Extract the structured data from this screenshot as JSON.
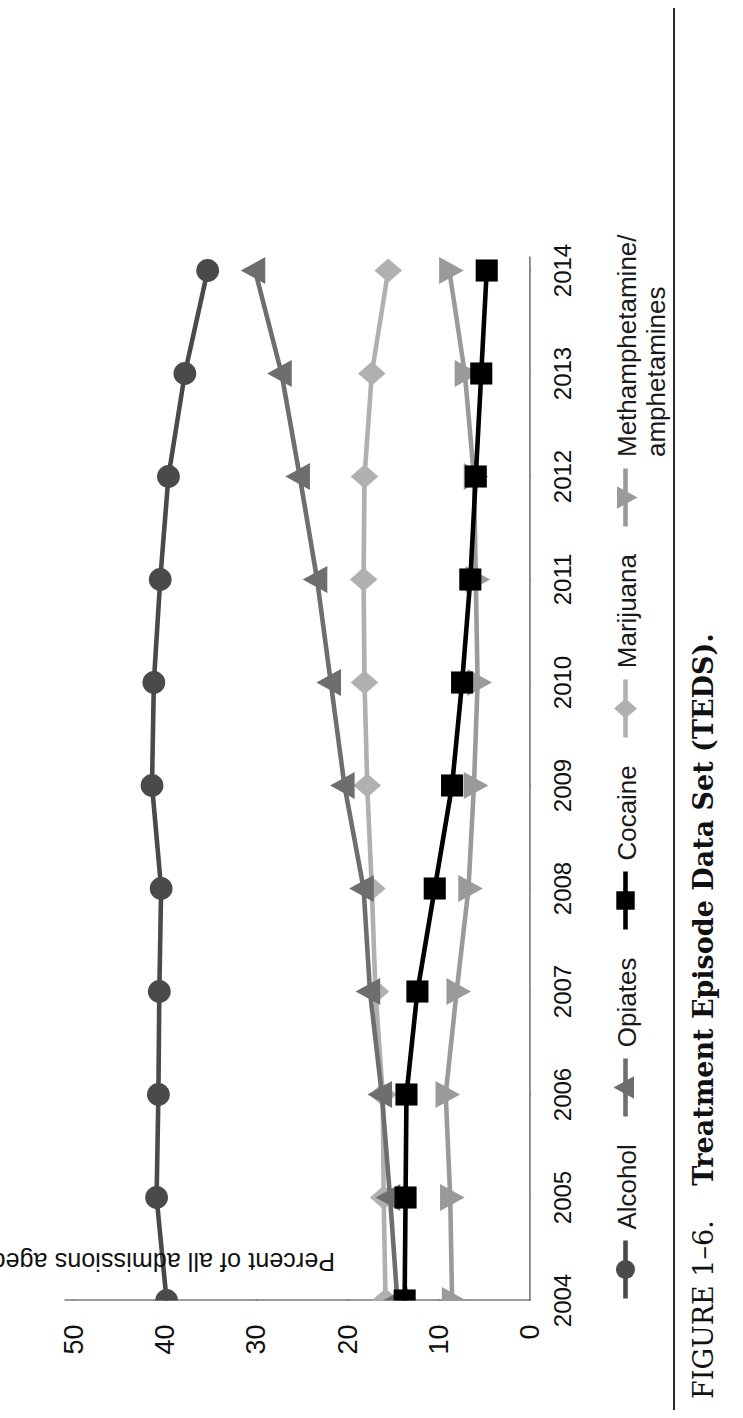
{
  "caption": {
    "figure_number": "FIGURE 1–6.",
    "title": "Treatment Episode Data Set (TEDS)."
  },
  "chart_data": {
    "type": "line",
    "title": "",
    "subtitle": "",
    "xlabel": "",
    "ylabel": "Percent of all admissions aged 12 and older",
    "xlim": [
      2004,
      2014
    ],
    "ylim": [
      0,
      50
    ],
    "yticks": [
      0,
      10,
      20,
      30,
      40,
      50
    ],
    "ytick_labels": [
      "0",
      "10",
      "20",
      "30",
      "40",
      "50"
    ],
    "grid": false,
    "legend_position": "bottom",
    "orientation": "page-rotated-90",
    "categories": [
      2004,
      2005,
      2006,
      2007,
      2008,
      2009,
      2010,
      2011,
      2012,
      2013,
      2014
    ],
    "xtick_labels": [
      "2004",
      "2005",
      "2006",
      "2007",
      "2008",
      "2009",
      "2010",
      "2011",
      "2012",
      "2013",
      "2014"
    ],
    "series": [
      {
        "name": "Alcohol",
        "marker": "circle",
        "color": "#4a4a4a",
        "values": [
          39.9,
          41.0,
          40.8,
          40.7,
          40.5,
          41.5,
          41.3,
          40.6,
          39.7,
          37.9,
          35.4
        ]
      },
      {
        "name": "Opiates",
        "marker": "triangle",
        "color": "#6e6e6e",
        "values": [
          14.6,
          15.4,
          16.3,
          17.6,
          18.3,
          20.4,
          21.9,
          23.4,
          25.3,
          27.3,
          30.2
        ]
      },
      {
        "name": "Cocaine",
        "marker": "square",
        "color": "#000000",
        "values": [
          13.8,
          13.7,
          13.6,
          12.4,
          10.5,
          8.6,
          7.5,
          6.6,
          6.0,
          5.4,
          4.8
        ]
      },
      {
        "name": "Marijuana",
        "marker": "diamond",
        "color": "#b0b0b0",
        "values": [
          15.9,
          16.1,
          16.2,
          17.0,
          17.4,
          17.9,
          18.2,
          18.3,
          18.2,
          17.4,
          15.6
        ]
      },
      {
        "name": "Methamphetamine/\namphetamines",
        "marker": "triangle-left",
        "color": "#9a9a9a",
        "values": [
          8.6,
          8.8,
          9.3,
          8.1,
          6.8,
          6.2,
          5.8,
          6.0,
          6.2,
          7.2,
          8.9
        ]
      }
    ]
  },
  "legend": {
    "items": [
      {
        "label": "Alcohol",
        "marker": "circle",
        "color": "#4a4a4a"
      },
      {
        "label": "Opiates",
        "marker": "triangle",
        "color": "#6e6e6e"
      },
      {
        "label": "Cocaine",
        "marker": "square",
        "color": "#000000"
      },
      {
        "label": "Marijuana",
        "marker": "diamond",
        "color": "#b0b0b0"
      },
      {
        "label": "Methamphetamine/\namphetamines",
        "marker": "triangle-left",
        "color": "#9a9a9a"
      }
    ]
  }
}
